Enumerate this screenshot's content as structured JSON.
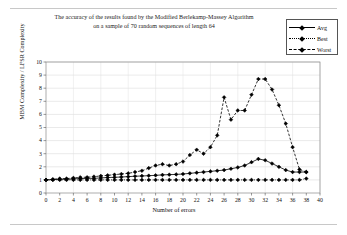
{
  "chart_data": {
    "type": "line",
    "title": "The accuracy of the results found by the Modified Berlekamp-Massey Algorithm on a sample of 70 random sequences of length 64",
    "title_lines": [
      "The accuracy of the results found by the Modified Berlekamp-Massey Algorithm",
      "on a sample of 70 random sequences of length 64"
    ],
    "xlabel": "Number of errors",
    "ylabel": "MBM Complexity / LFSR Complexity",
    "xlim": [
      0,
      40
    ],
    "ylim": [
      0,
      10
    ],
    "xticks": [
      0,
      2,
      4,
      6,
      8,
      10,
      12,
      14,
      16,
      18,
      20,
      22,
      24,
      26,
      28,
      30,
      32,
      34,
      36,
      38,
      40
    ],
    "yticks": [
      0,
      1,
      2,
      3,
      4,
      5,
      6,
      7,
      8,
      9,
      10
    ],
    "grid": true,
    "legend_position": "top-right",
    "x": [
      0,
      1,
      2,
      3,
      4,
      5,
      6,
      7,
      8,
      9,
      10,
      11,
      12,
      13,
      14,
      15,
      16,
      17,
      18,
      19,
      20,
      21,
      22,
      23,
      24,
      25,
      26,
      27,
      28,
      29,
      30,
      31,
      32,
      33,
      34,
      35,
      36,
      37,
      38
    ],
    "series": [
      {
        "name": "Avg",
        "line_style": "solid",
        "marker": "diamond",
        "color": "#000000",
        "values": [
          1.0,
          1.02,
          1.05,
          1.05,
          1.08,
          1.1,
          1.12,
          1.12,
          1.15,
          1.18,
          1.2,
          1.22,
          1.25,
          1.28,
          1.3,
          1.32,
          1.35,
          1.38,
          1.4,
          1.42,
          1.45,
          1.5,
          1.55,
          1.6,
          1.65,
          1.7,
          1.75,
          1.85,
          1.95,
          2.1,
          2.35,
          2.6,
          2.5,
          2.25,
          2.0,
          1.75,
          1.6,
          1.6,
          1.6
        ]
      },
      {
        "name": "Best",
        "line_style": "dotted",
        "marker": "diamond",
        "color": "#000000",
        "values": [
          1.0,
          1.0,
          1.0,
          1.0,
          1.0,
          1.0,
          1.0,
          1.0,
          1.0,
          1.0,
          1.0,
          1.0,
          1.0,
          1.0,
          1.0,
          1.0,
          1.0,
          1.0,
          1.0,
          1.0,
          1.0,
          1.0,
          1.0,
          1.0,
          1.0,
          1.0,
          1.0,
          1.0,
          1.0,
          1.0,
          1.0,
          1.0,
          1.0,
          1.0,
          1.0,
          1.0,
          1.0,
          1.0,
          1.1
        ]
      },
      {
        "name": "Worst",
        "line_style": "dashed",
        "marker": "diamond",
        "color": "#000000",
        "values": [
          1.0,
          1.05,
          1.1,
          1.1,
          1.15,
          1.2,
          1.2,
          1.25,
          1.3,
          1.35,
          1.4,
          1.45,
          1.5,
          1.6,
          1.7,
          1.9,
          2.1,
          2.2,
          2.1,
          2.2,
          2.4,
          2.9,
          3.3,
          3.0,
          3.5,
          4.4,
          7.3,
          5.6,
          6.3,
          6.3,
          7.5,
          8.7,
          8.7,
          7.9,
          6.7,
          5.3,
          3.5,
          1.8,
          1.6
        ]
      }
    ]
  },
  "legend": {
    "items": [
      {
        "label": "Avg",
        "style": "solid"
      },
      {
        "label": "Best",
        "style": "dotted"
      },
      {
        "label": "Worst",
        "style": "dashed"
      }
    ]
  }
}
